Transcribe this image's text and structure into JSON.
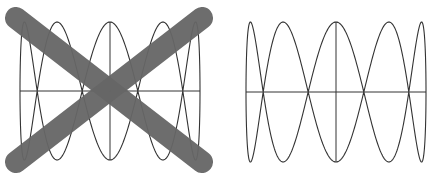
{
  "figures": [
    {
      "id": "left",
      "description": "Lissajous figure crossed out",
      "curve": {
        "cx": 110,
        "cy": 91,
        "ax": 90,
        "ay": 69,
        "fx": 1,
        "fy": 5,
        "phase": 1.5708
      },
      "axes": {
        "x1": 20,
        "x2": 200,
        "y1": 22,
        "y2": 160
      },
      "cross": {
        "color": "#666666",
        "width": 22,
        "lines": [
          [
            16,
            18,
            202,
            162
          ],
          [
            202,
            18,
            16,
            162
          ]
        ]
      },
      "stroke": "#333333"
    },
    {
      "id": "right",
      "description": "Lissajous figure correct",
      "curve": {
        "cx": 118,
        "cy": 92,
        "ax": 90,
        "ay": 70,
        "fx": 1,
        "fy": 5,
        "phase": 1.5708
      },
      "axes": {
        "x1": 28,
        "x2": 208,
        "y1": 22,
        "y2": 162
      },
      "stroke": "#333333"
    }
  ]
}
